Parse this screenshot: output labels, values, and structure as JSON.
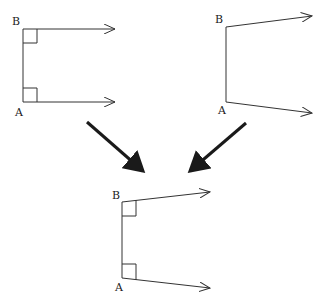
{
  "colors": {
    "line": "#333333",
    "big_arrow": "#1a1a1a",
    "label": "#222222",
    "background": "#ffffff"
  },
  "figures": [
    {
      "id": "top-left",
      "description": "Two parallel rays perpendicular to segment AB",
      "label_top": "B",
      "label_bottom": "A",
      "right_angle_at_B": true,
      "right_angle_at_A": true
    },
    {
      "id": "top-right",
      "description": "Two rays diverging from segment AB",
      "label_top": "B",
      "label_bottom": "A",
      "right_angle_at_B": false,
      "right_angle_at_A": false
    },
    {
      "id": "bottom",
      "description": "Two diverging rays each marked with right angle to AB",
      "label_top": "B",
      "label_bottom": "A",
      "right_angle_at_B": true,
      "right_angle_at_A": true
    }
  ],
  "connectors": [
    {
      "from": "top-left",
      "to": "bottom"
    },
    {
      "from": "top-right",
      "to": "bottom"
    }
  ]
}
